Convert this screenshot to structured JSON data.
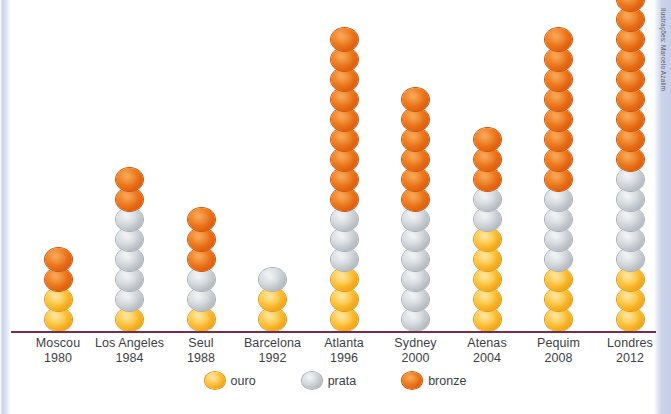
{
  "credit": "Ilustrações: Marcelo Azalim",
  "colors": {
    "ouro": "#f2a81d",
    "prata": "#b6bcc2",
    "bronze": "#ef7d1e",
    "axis": "#7a2a4a",
    "label_text": "#3e3e42"
  },
  "legend": {
    "items": [
      {
        "key": "ouro",
        "label": "ouro"
      },
      {
        "key": "prata",
        "label": "prata"
      },
      {
        "key": "bronze",
        "label": "bronze"
      }
    ]
  },
  "chart_data": {
    "type": "bar",
    "title": "",
    "subtitle": "",
    "xlabel": "",
    "ylabel": "",
    "grid": false,
    "legend_position": "bottom",
    "stacked": true,
    "ylim": [
      0,
      17
    ],
    "categories": [
      "Moscou",
      "Los Angeles",
      "Seul",
      "Barcelona",
      "Atlanta",
      "Sydney",
      "Atenas",
      "Pequim",
      "Londres"
    ],
    "years": [
      "1980",
      "1984",
      "1988",
      "1992",
      "1996",
      "2000",
      "2004",
      "2008",
      "2012"
    ],
    "series": [
      {
        "name": "ouro",
        "values": [
          2,
          1,
          1,
          2,
          3,
          0,
          5,
          3,
          3
        ]
      },
      {
        "name": "prata",
        "values": [
          0,
          5,
          2,
          1,
          3,
          6,
          2,
          4,
          5
        ]
      },
      {
        "name": "bronze",
        "values": [
          2,
          2,
          3,
          0,
          9,
          6,
          3,
          8,
          9
        ]
      }
    ],
    "totals": [
      4,
      8,
      6,
      3,
      15,
      12,
      10,
      15,
      17
    ]
  }
}
